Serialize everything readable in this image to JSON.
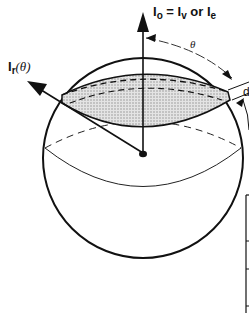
{
  "diagram": {
    "type": "sphere-geometry",
    "labels": {
      "top_I": "I",
      "top_sub_o": "o",
      "eq": " = I",
      "sub_v": "v",
      "or": " or I",
      "sub_e": "e",
      "left_I": "I",
      "left_sub_r": "r",
      "left_arg": "(θ)",
      "theta": "θ",
      "d_label": "d"
    },
    "colors": {
      "stroke": "#111111",
      "band_fill": "#c8c8c8",
      "background": "#ffffff"
    },
    "elements": [
      "sphere-outline",
      "vertical-axis-arrow",
      "radial-arrow",
      "shaded-band",
      "equator-ellipse",
      "theta-arc",
      "center-dot",
      "d-theta-marker",
      "side-frame"
    ]
  }
}
